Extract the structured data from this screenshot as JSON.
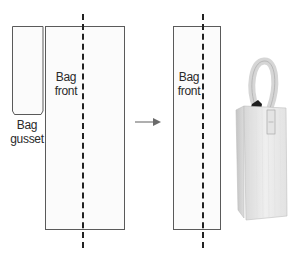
{
  "diagram": {
    "left_group": {
      "gusset": {
        "label_line1": "Bag",
        "label_line2": "gusset"
      },
      "front": {
        "label_line1": "Bag",
        "label_line2": "front"
      }
    },
    "arrow": {
      "direction": "right"
    },
    "right_group": {
      "front": {
        "label_line1": "Bag",
        "label_line2": "front"
      }
    },
    "photo": {
      "subject": "finished tall bag with loop handle"
    },
    "colors": {
      "outline": "#5a5a5a",
      "fold_line": "#222222",
      "text": "#2a2a2a",
      "bag_fill": "#e9e9e9"
    }
  }
}
